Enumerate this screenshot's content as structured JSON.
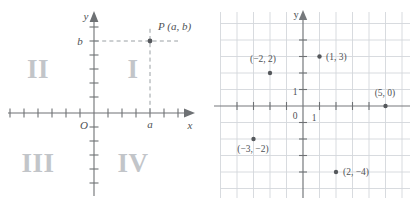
{
  "figure": {
    "panels": [
      {
        "id": "quadrant-diagram",
        "axis_labels": {
          "x": "x",
          "y": "y",
          "origin": "O"
        },
        "quadrants": [
          {
            "name": "quadrant-1",
            "label": "I"
          },
          {
            "name": "quadrant-2",
            "label": "II"
          },
          {
            "name": "quadrant-3",
            "label": "III"
          },
          {
            "name": "quadrant-4",
            "label": "IV"
          }
        ],
        "point": {
          "label": "P (a, b)",
          "x_label": "a",
          "y_label": "b"
        }
      },
      {
        "id": "plotted-points-grid",
        "axis_labels": {
          "x": "",
          "y": "y",
          "origin": "0"
        },
        "unit_labels": {
          "x_unit": "1",
          "y_unit": "1"
        },
        "points": [
          {
            "label": "(−2, 2)",
            "x": -2,
            "y": 2
          },
          {
            "label": "(1, 3)",
            "x": 1,
            "y": 3
          },
          {
            "label": "(5, 0)",
            "x": 5,
            "y": 0
          },
          {
            "label": "(−3, −2)",
            "x": -3,
            "y": -2
          },
          {
            "label": "(2, −4)",
            "x": 2,
            "y": -4
          }
        ]
      }
    ],
    "colors": {
      "axis": "#6e7174",
      "grid": "#d4d7db",
      "dot": "#55585c",
      "quadrant_text": "#c2c5c9",
      "label_text": "#4e5154",
      "background": "#ffffff"
    }
  }
}
